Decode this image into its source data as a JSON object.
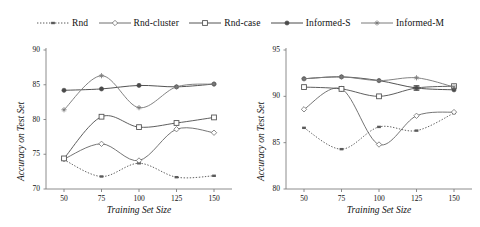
{
  "legend": {
    "position": "top",
    "items": [
      {
        "label": "Rnd",
        "marker": "small-filled-square-marker",
        "dash": "dotted",
        "color": "#5a5a5a"
      },
      {
        "label": "Rnd-cluster",
        "marker": "open-diamond-marker",
        "dash": "dashed",
        "color": "#6e6e6e"
      },
      {
        "label": "Rnd-case",
        "marker": "open-square-marker",
        "dash": "solid",
        "color": "#555555"
      },
      {
        "label": "Informed-S",
        "marker": "filled-circle-marker",
        "dash": "solid",
        "color": "#4a4a4a"
      },
      {
        "label": "Informed-M",
        "marker": "asterisk-star-marker",
        "dash": "solid",
        "color": "#7b7b7b"
      }
    ]
  },
  "chart_data": [
    {
      "type": "line",
      "panel": "left",
      "title": "",
      "xlabel": "Training Set Size",
      "ylabel": "Accuracy on Test Set",
      "x": [
        50,
        75,
        100,
        125,
        150
      ],
      "xticklabels": [
        "50",
        "75",
        "100",
        "125",
        "150"
      ],
      "xlim": [
        38,
        162
      ],
      "ylim": [
        70,
        90
      ],
      "yticks": [
        70,
        75,
        80,
        85,
        90
      ],
      "yticklabels": [
        "70",
        "75",
        "80",
        "85",
        "90"
      ],
      "grid": false,
      "smooth": true,
      "series": [
        {
          "name": "Rnd",
          "values": [
            74.2,
            71.8,
            73.7,
            71.7,
            71.9
          ]
        },
        {
          "name": "Rnd-cluster",
          "values": [
            74.3,
            76.5,
            74.1,
            78.6,
            78.1
          ]
        },
        {
          "name": "Rnd-case",
          "values": [
            74.4,
            80.4,
            78.9,
            79.5,
            80.3
          ]
        },
        {
          "name": "Informed-S",
          "values": [
            84.2,
            84.4,
            84.9,
            84.7,
            85.1
          ]
        },
        {
          "name": "Informed-M",
          "values": [
            81.4,
            86.3,
            81.7,
            84.7,
            85.1
          ]
        }
      ]
    },
    {
      "type": "line",
      "panel": "right",
      "title": "",
      "xlabel": "Training Set Size",
      "ylabel": "Accuracy on Test Set",
      "x": [
        50,
        75,
        100,
        125,
        150
      ],
      "xticklabels": [
        "50",
        "75",
        "100",
        "125",
        "150"
      ],
      "xlim": [
        38,
        162
      ],
      "ylim": [
        80,
        95
      ],
      "yticks": [
        80,
        85,
        90,
        95
      ],
      "yticklabels": [
        "80",
        "85",
        "90",
        "95"
      ],
      "grid": false,
      "smooth": true,
      "series": [
        {
          "name": "Rnd",
          "values": [
            86.6,
            84.3,
            86.7,
            86.3,
            88.2
          ]
        },
        {
          "name": "Rnd-cluster",
          "values": [
            88.6,
            90.8,
            84.8,
            87.9,
            88.3
          ]
        },
        {
          "name": "Rnd-case",
          "values": [
            91.0,
            90.8,
            90.0,
            90.9,
            91.1
          ]
        },
        {
          "name": "Informed-S",
          "values": [
            91.9,
            92.1,
            91.7,
            90.9,
            90.7
          ]
        },
        {
          "name": "Informed-M",
          "values": [
            91.9,
            92.1,
            91.7,
            92.0,
            91.0
          ]
        }
      ]
    }
  ]
}
